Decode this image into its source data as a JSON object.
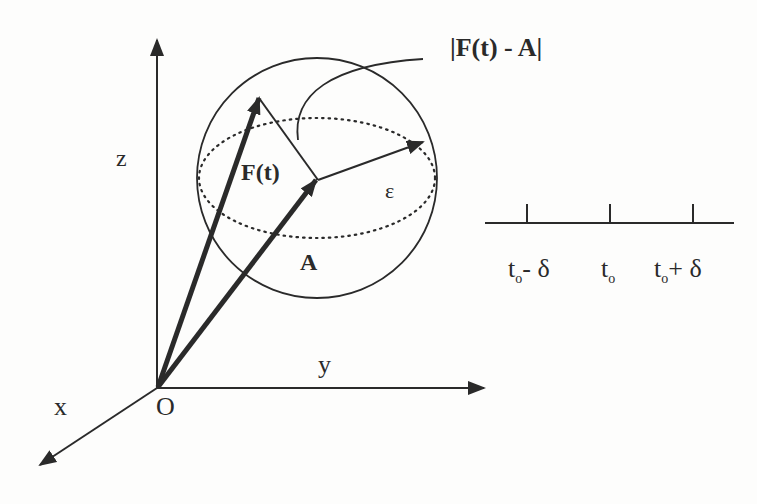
{
  "diagram": {
    "title_label": "|F(t) - A|",
    "axes": {
      "z": "z",
      "y": "y",
      "x": "x",
      "origin": "O"
    },
    "vectors": {
      "F": "F(t)",
      "A": "A",
      "epsilon": "ε"
    },
    "timeline": {
      "ticks": [
        {
          "t": "t",
          "sub": "o",
          "suffix": "- δ"
        },
        {
          "t": "t",
          "sub": "o",
          "suffix": ""
        },
        {
          "t": "t",
          "sub": "o",
          "suffix": "+ δ"
        }
      ]
    },
    "colors": {
      "ink": "#2a2a2a",
      "background": "#fdfdfc"
    }
  }
}
